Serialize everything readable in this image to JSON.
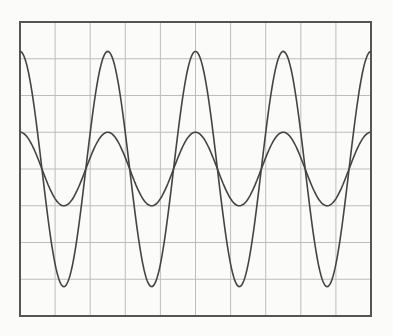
{
  "diagram": {
    "type": "oscilloscope-trace",
    "grid": {
      "columns": 10,
      "rows": 8
    },
    "colors": {
      "background": "#fbfbf9",
      "frame": "#555555",
      "grid": "#bdbdbd",
      "trace": "#444444"
    },
    "traces": [
      {
        "name": "large-wave",
        "amplitude_div": 3.2,
        "period_div": 2.5,
        "phase": "cos"
      },
      {
        "name": "small-wave",
        "amplitude_div": 1.0,
        "period_div": 2.5,
        "phase": "cos"
      }
    ]
  }
}
